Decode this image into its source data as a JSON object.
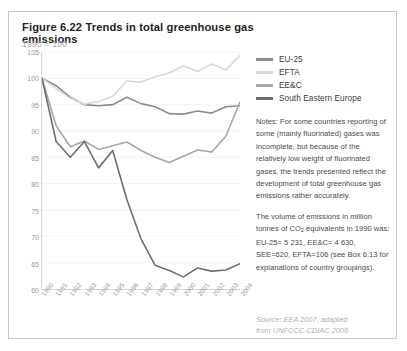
{
  "figure": {
    "title": "Figure 6.22 Trends in total greenhouse gas emissions",
    "subtitle": "1990 = 100"
  },
  "legend": {
    "position": "top-right",
    "items": [
      {
        "label": "EU-25",
        "color": "#8c8c8c"
      },
      {
        "label": "EFTA",
        "color": "#d8d8d8"
      },
      {
        "label": "EE&C",
        "color": "#a8a8a8"
      },
      {
        "label": "South Eastern Europe",
        "color": "#6e6e6e"
      }
    ]
  },
  "notes": {
    "paragraphs": [
      "Notes: For some countries reporting of some (mainly fluorinated) gases was incomplete, but because of the relatively low weight of fluorinated gases, the trends presented reflect the development of total greenhouse gas emissions rather accurately.",
      "The volume of emissions in million tonnes of CO2 equivalents in 1990 was: EU-25= 5 231, EE&C= 4 630, SEE=620, EFTA=106 (see Box 6.13 for explanations of country groupings)."
    ]
  },
  "source": {
    "line1": "Source: EEA 2007, adapted",
    "line2": "from UNFCCC-CDIAC 2006"
  },
  "chart_data": {
    "type": "line",
    "title": "Figure 6.22 Trends in total greenhouse gas emissions",
    "subtitle": "1990 = 100",
    "xlabel": "",
    "ylabel": "",
    "grid": true,
    "legend_position": "top-right",
    "x": [
      "1990",
      "1991",
      "1992",
      "1993",
      "1994",
      "1995",
      "1996",
      "1997",
      "1998",
      "1999",
      "2000",
      "2001",
      "2002",
      "2003",
      "2004"
    ],
    "xlim": [
      1990,
      2004
    ],
    "ylim": [
      60,
      105
    ],
    "yticks": [
      60,
      65,
      70,
      75,
      80,
      85,
      90,
      95,
      100,
      105
    ],
    "series": [
      {
        "name": "EU-25",
        "color": "#8c8c8c",
        "values": [
          100.0,
          98.6,
          96.4,
          95.0,
          94.8,
          95.0,
          96.4,
          95.2,
          94.6,
          93.3,
          93.2,
          93.8,
          93.4,
          94.6,
          94.8
        ]
      },
      {
        "name": "EFTA",
        "color": "#d8d8d8",
        "values": [
          100.0,
          98.1,
          96.2,
          95.1,
          95.6,
          96.6,
          99.5,
          99.3,
          100.3,
          101.0,
          102.4,
          101.3,
          102.7,
          101.6,
          104.3
        ]
      },
      {
        "name": "EE&C",
        "color": "#a8a8a8",
        "values": [
          100.0,
          91.0,
          87.0,
          88.1,
          86.5,
          87.2,
          87.9,
          86.3,
          85.0,
          84.0,
          85.2,
          86.4,
          86.0,
          89.0,
          95.5
        ]
      },
      {
        "name": "South Eastern Europe",
        "color": "#6e6e6e",
        "values": [
          100.0,
          88.0,
          85.0,
          88.0,
          83.0,
          86.3,
          77.0,
          69.5,
          64.5,
          63.5,
          62.3,
          64.0,
          63.4,
          63.6,
          64.8
        ]
      }
    ]
  }
}
